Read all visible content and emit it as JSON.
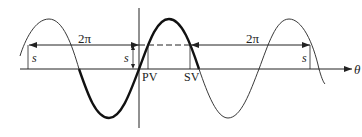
{
  "diagram": {
    "labels": {
      "period_left": "2π",
      "period_right": "2π",
      "s_left": "s",
      "s_center": "s",
      "s_right": "s",
      "pv": "PV",
      "sv": "SV",
      "axis": "θ"
    },
    "colors": {
      "line": "#222222",
      "background": "#ffffff"
    }
  }
}
